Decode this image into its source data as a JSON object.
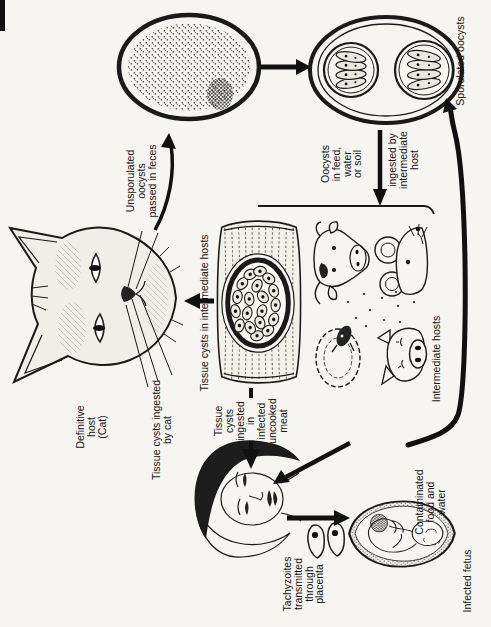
{
  "meta": {
    "figure_kind": "parasite-life-cycle-diagram",
    "ink_color": "#1a1a1a",
    "paper_color": "#f6f5f1",
    "orientation": "landscape figure rotated 90 degrees counterclockwise on portrait page"
  },
  "labels": {
    "definitive_host": {
      "lines": [
        "Definitive",
        "host",
        "(Cat)"
      ]
    },
    "tissue_cysts_ingested_by_cat": {
      "lines": [
        "Tissue cysts ingested",
        "by cat"
      ]
    },
    "tissue_cysts_in_hosts": {
      "lines": [
        "Tissue cysts in intermediate hosts"
      ]
    },
    "unsporulated_oocysts": {
      "lines": [
        "Unsporulated",
        "oocysts",
        "passed in feces"
      ]
    },
    "oocysts_in_feed": {
      "lines": [
        "Oocysts",
        "in feed,",
        "water",
        "or soil"
      ]
    },
    "ingested_by_intermediate_host": {
      "lines": [
        "ingested by",
        "intermediate",
        "host"
      ]
    },
    "sporulated_oocysts": {
      "lines": [
        "Sporulated oocysts"
      ]
    },
    "intermediate_hosts": {
      "lines": [
        "Intermediate hosts"
      ]
    },
    "tissue_cysts_uncooked_meat": {
      "lines": [
        "Tissue",
        "cysts",
        "ingested",
        "in",
        "infected",
        "uncooked",
        "meat"
      ]
    },
    "contaminated_food": {
      "lines": [
        "Contaminated",
        "food and",
        "water"
      ]
    },
    "tachyzoites_placenta": {
      "lines": [
        "Tachyzoites",
        "transmitted",
        "through",
        "placenta"
      ]
    },
    "infected_fetus": {
      "lines": [
        "Infected fetus"
      ]
    }
  },
  "illustrations": {
    "cat_head": "cat head (definitive host)",
    "unsporulated_oocyst": "unsporulated oocyst (stippled sphere)",
    "sporulated_oocyst": "sporulated oocyst with two sporocysts of four sporozoites",
    "muscle_tissue_cyst": "striated muscle with bradyzoite-filled tissue cyst",
    "intermediate_host_animals": "cow, sheep, pig and mouse heads",
    "human_head": "human (woman) head",
    "tachyzoites": "two crescent tachyzoites",
    "fetus": "infected fetus in utero"
  }
}
